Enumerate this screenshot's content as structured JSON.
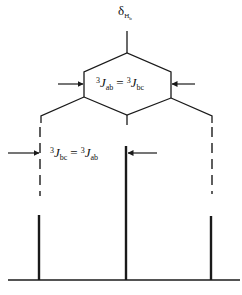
{
  "diagram": {
    "type": "NMR splitting tree (triplet from equal coupling constants)",
    "top_label": {
      "symbol": "δ",
      "subscript": "H",
      "subsubscript": "b"
    },
    "hexagon_label": {
      "left_sup": "3",
      "left_var": "J",
      "left_sub": "ab",
      "equals": "=",
      "right_sup": "3",
      "right_var": "J",
      "right_sub": "bc"
    },
    "second_split_label": {
      "left_sup": "3",
      "left_var": "J",
      "left_sub": "bc",
      "equals": "=",
      "right_sup": "3",
      "right_var": "J",
      "right_sub": "ab"
    },
    "peaks": [
      {
        "name": "left-peak",
        "relative_intensity": 1
      },
      {
        "name": "center-peak",
        "relative_intensity": 2
      },
      {
        "name": "right-peak",
        "relative_intensity": 1
      }
    ],
    "colors": {
      "line": "#1a1a1a",
      "background": "#ffffff"
    }
  }
}
